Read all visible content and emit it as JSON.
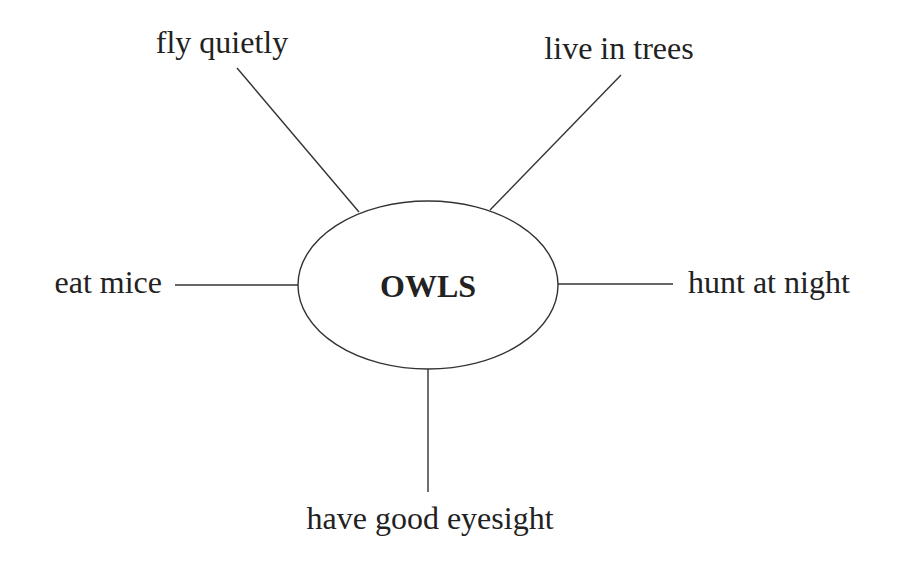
{
  "diagram": {
    "type": "concept-web",
    "center": {
      "label": "OWLS"
    },
    "branches": [
      {
        "id": "top-left",
        "label": "fly quietly"
      },
      {
        "id": "top-right",
        "label": "live in trees"
      },
      {
        "id": "left",
        "label": "eat mice"
      },
      {
        "id": "right",
        "label": "hunt at night"
      },
      {
        "id": "bottom",
        "label": "have good eyesight"
      }
    ]
  }
}
